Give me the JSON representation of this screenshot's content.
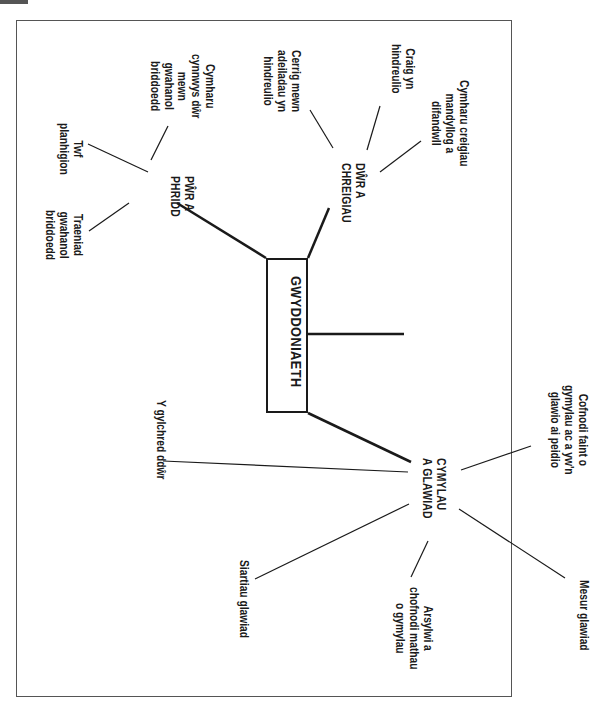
{
  "title": "GWYDDONIAETH",
  "colors": {
    "ink": "#1a1a1a",
    "frame": "#555555",
    "background": "#ffffff"
  },
  "branches": [
    {
      "id": "pwr-a-phridd",
      "label": "PŴR A\nPHRIDD",
      "leaves": [
        "Twf\nplanhigion",
        "Cymharu\ncynnwys dŵr\nmewn\ngwahanol\nbriddoedd",
        "Traeniad\ngwahanol\nbriddoedd"
      ]
    },
    {
      "id": "dwr-a-chreigiau",
      "label": "DŴR A\nCHREIGIAU",
      "leaves": [
        "Cerrig mewn\nadeiladau yn\nhindreulio",
        "Craig yn\nhindreulio",
        "Cymharu creigiau\nmandyllog a\ndifandwll"
      ]
    },
    {
      "id": "cymylau-a-glawiad",
      "label": "CYMYLAU\nA GLAWIAD",
      "leaves": [
        "Cofnodi faint o\ngymylau ac a yw'n\nglawio ai peidio",
        "Y gylchred ddŵr",
        "Siartiau glawiad",
        "Arsylwi a\nchofnodi mathau\no gymylau",
        "Mesur glawiad"
      ]
    },
    {
      "id": "empty-branch",
      "label": "",
      "leaves": []
    }
  ]
}
